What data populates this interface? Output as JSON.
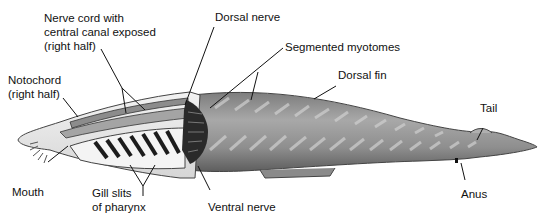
{
  "labels": {
    "nerve_cord": "Nerve cord with\ncentral canal exposed\n(right half)",
    "notochord": "Notochord\n(right half)",
    "dorsal_nerve": "Dorsal nerve",
    "segmented_myotomes": "Segmented myotomes",
    "dorsal_fin": "Dorsal fin",
    "tail": "Tail",
    "mouth": "Mouth",
    "gill_slits": "Gill slits\nof pharynx",
    "ventral_nerve": "Ventral nerve",
    "anus": "Anus"
  },
  "colors": {
    "body": "#9a9a9a",
    "body_dark": "#6e6e6e",
    "cut_surface": "#e8e8e8",
    "gill_bar": "#1c1c1c",
    "nerve": "#2a2a2a",
    "leader": "#111111"
  }
}
